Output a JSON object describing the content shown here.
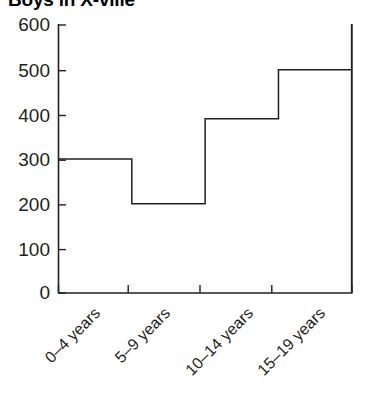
{
  "chart_data": {
    "type": "line",
    "subtype": "step",
    "title": "Boys in X-ville",
    "xlabel": "",
    "ylabel": "",
    "categories": [
      "0–4 years",
      "5–9 years",
      "10–14 years",
      "15–19 years"
    ],
    "values": [
      300,
      200,
      390,
      500
    ],
    "series": [
      {
        "name": "Boys",
        "values": [
          300,
          200,
          390,
          500
        ]
      }
    ],
    "ylim": [
      0,
      600
    ],
    "yticks": [
      0,
      100,
      200,
      300,
      400,
      500,
      600
    ],
    "ytick_labels": [
      "0",
      "100",
      "200",
      "300",
      "400",
      "500",
      "600"
    ],
    "xtick_labels": [
      "0–4 years",
      "5–9 years",
      "10–14 years",
      "15–19 years"
    ],
    "xtick_rotation_degrees": -45,
    "grid": false,
    "legend": false,
    "legend_position": "none",
    "line_color": "#231f20",
    "axis_color": "#231f20",
    "background_color": "#ffffff"
  },
  "figure": {
    "title": "Boys in X-ville",
    "title_clipped": true
  },
  "axes": {
    "y_axis_name": "y-axis",
    "x_axis_name": "x-axis",
    "y_tick_labels": [
      "600",
      "500",
      "400",
      "300",
      "200",
      "100",
      "0"
    ],
    "x_tick_labels": [
      "0–4 years",
      "5–9 years",
      "10–14 years",
      "15–19 years"
    ]
  }
}
